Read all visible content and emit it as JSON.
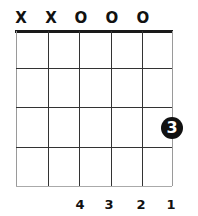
{
  "chord_diagram": {
    "string_markers": [
      {
        "string": 1,
        "symbol": "X",
        "x": 21
      },
      {
        "string": 2,
        "symbol": "X",
        "x": 51
      },
      {
        "string": 3,
        "symbol": "O",
        "x": 81
      },
      {
        "string": 4,
        "symbol": "O",
        "x": 112
      },
      {
        "string": 5,
        "symbol": "O",
        "x": 143
      }
    ],
    "strings_x": [
      16,
      48,
      79,
      111,
      142,
      172
    ],
    "frets_y": [
      68,
      107,
      147,
      186
    ],
    "finger_dot": {
      "string": 6,
      "fret": 3,
      "label": "3",
      "x": 172,
      "y": 128
    },
    "bottom_fingering": [
      {
        "string": 3,
        "label": "4",
        "x": 80
      },
      {
        "string": 4,
        "label": "3",
        "x": 109
      },
      {
        "string": 5,
        "label": "2",
        "x": 141
      },
      {
        "string": 6,
        "label": "1",
        "x": 171
      }
    ],
    "colors": {
      "ink": "#111111",
      "background": "#ffffff"
    }
  }
}
